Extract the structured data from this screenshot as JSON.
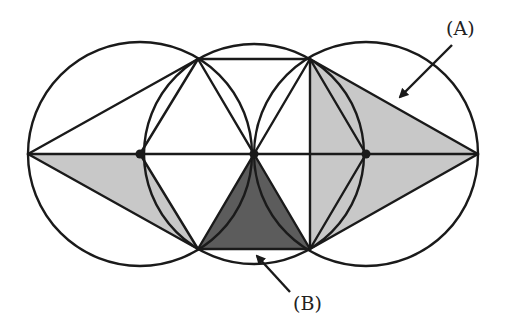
{
  "diagram": {
    "labels": {
      "A": "(A)",
      "B": "(B)"
    },
    "colors": {
      "stroke": "#1a1a1a",
      "light_shade": "#c8c8c8",
      "dark_shade": "#5c5c5c",
      "background": "#ffffff"
    },
    "circles": [
      {
        "cx": 140,
        "cy": 154,
        "r": 112
      },
      {
        "cx": 254,
        "cy": 154,
        "r": 110
      },
      {
        "cx": 366,
        "cy": 154,
        "r": 112
      }
    ],
    "points": {
      "left_outer": [
        28,
        154
      ],
      "left_center": [
        140,
        154
      ],
      "mid_center": [
        254,
        154
      ],
      "right_center": [
        366,
        154
      ],
      "right_outer": [
        478,
        154
      ],
      "top_left": [
        198,
        59
      ],
      "top_right": [
        310,
        59
      ],
      "bottom_left": [
        198,
        249
      ],
      "bottom_right": [
        310,
        249
      ]
    }
  }
}
